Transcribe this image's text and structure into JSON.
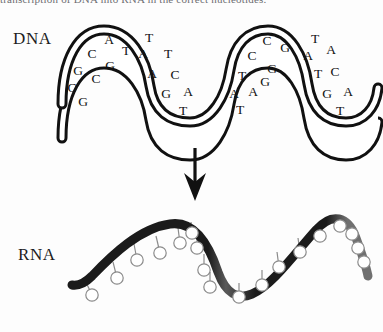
{
  "figure": {
    "title_sliver": "transcription of DNA into RNA in the correct nucleotides.",
    "background_color": "#fdfdfd",
    "ink_color": "#111111",
    "rna_ribbon_color": "#1b1b1b",
    "rna_ribbon_shade_color": "#6b6b6b"
  },
  "labels": {
    "dna": "DNA",
    "rna": "RNA"
  },
  "arrow": {
    "name": "transcription-arrow",
    "direction": "down",
    "x": 195,
    "y_top": 148,
    "y_bottom": 200
  },
  "dna": {
    "description": "Double helix ribbon with paired bases written between the two strands",
    "turns": 4,
    "segments": [
      {
        "index": 1,
        "pairs": [
          {
            "left": "A",
            "right": "T"
          },
          {
            "left": "C",
            "right": "G"
          },
          {
            "left": "G",
            "right": "C"
          },
          {
            "left": "C",
            "right": "G"
          }
        ],
        "letters": [
          {
            "char": "A",
            "x": 109,
            "y": 44
          },
          {
            "char": "T",
            "x": 126,
            "y": 55
          },
          {
            "char": "C",
            "x": 92,
            "y": 58
          },
          {
            "char": "G",
            "x": 110,
            "y": 70
          },
          {
            "char": "G",
            "x": 78,
            "y": 75
          },
          {
            "char": "C",
            "x": 96,
            "y": 83
          },
          {
            "char": "C",
            "x": 72,
            "y": 92
          },
          {
            "char": "G",
            "x": 83,
            "y": 106
          }
        ]
      },
      {
        "index": 2,
        "pairs": [
          {
            "left": "T",
            "right": "A"
          },
          {
            "left": "A",
            "right": "T"
          },
          {
            "left": "A",
            "right": "C"
          },
          {
            "left": "G",
            "right": "A"
          },
          {
            "left": "T",
            "right": ""
          }
        ],
        "letters": [
          {
            "char": "T",
            "x": 149,
            "y": 42
          },
          {
            "char": "A",
            "x": 143,
            "y": 58
          },
          {
            "char": "T",
            "x": 168,
            "y": 58
          },
          {
            "char": "A",
            "x": 152,
            "y": 78
          },
          {
            "char": "C",
            "x": 175,
            "y": 79
          },
          {
            "char": "G",
            "x": 166,
            "y": 98
          },
          {
            "char": "A",
            "x": 188,
            "y": 96
          },
          {
            "char": "T",
            "x": 183,
            "y": 115
          }
        ]
      },
      {
        "index": 3,
        "pairs": [
          {
            "left": "C",
            "right": "G"
          },
          {
            "left": "C",
            "right": "G"
          },
          {
            "left": "T",
            "right": "G"
          },
          {
            "left": "A",
            "right": "A"
          },
          {
            "left": "T",
            "right": ""
          }
        ],
        "letters": [
          {
            "char": "C",
            "x": 267,
            "y": 45
          },
          {
            "char": "G",
            "x": 285,
            "y": 52
          },
          {
            "char": "C",
            "x": 252,
            "y": 60
          },
          {
            "char": "G",
            "x": 272,
            "y": 73
          },
          {
            "char": "T",
            "x": 242,
            "y": 80
          },
          {
            "char": "G",
            "x": 265,
            "y": 86
          },
          {
            "char": "A",
            "x": 234,
            "y": 98
          },
          {
            "char": "A",
            "x": 253,
            "y": 96
          },
          {
            "char": "T",
            "x": 240,
            "y": 114
          }
        ]
      },
      {
        "index": 4,
        "pairs": [
          {
            "left": "T",
            "right": "A"
          },
          {
            "left": "A",
            "right": "T"
          },
          {
            "left": "T",
            "right": "C"
          },
          {
            "left": "G",
            "right": "A"
          },
          {
            "left": "T",
            "right": ""
          }
        ],
        "letters": [
          {
            "char": "T",
            "x": 315,
            "y": 43
          },
          {
            "char": "A",
            "x": 331,
            "y": 54
          },
          {
            "char": "A",
            "x": 308,
            "y": 60
          },
          {
            "char": "T",
            "x": 318,
            "y": 78
          },
          {
            "char": "C",
            "x": 335,
            "y": 76
          },
          {
            "char": "G",
            "x": 327,
            "y": 98
          },
          {
            "char": "A",
            "x": 348,
            "y": 96
          },
          {
            "char": "T",
            "x": 340,
            "y": 115
          }
        ]
      }
    ]
  },
  "rna": {
    "description": "Single wavy strand with open-circle bases on short stalks",
    "wave_periods": 2,
    "base_count": 18,
    "bases": [
      {
        "cx": 92,
        "cy": 295,
        "stalk_x": 84,
        "stalk_y": 278
      },
      {
        "cx": 117,
        "cy": 278,
        "stalk_x": 113,
        "stalk_y": 262
      },
      {
        "cx": 137,
        "cy": 260,
        "stalk_x": 134,
        "stalk_y": 244
      },
      {
        "cx": 160,
        "cy": 253,
        "stalk_x": 156,
        "stalk_y": 236
      },
      {
        "cx": 180,
        "cy": 243,
        "stalk_x": 178,
        "stalk_y": 228
      },
      {
        "cx": 192,
        "cy": 233,
        "stalk_x": 191,
        "stalk_y": 222
      },
      {
        "cx": 197,
        "cy": 248,
        "stalk_x": 197,
        "stalk_y": 234
      },
      {
        "cx": 204,
        "cy": 270,
        "stalk_x": 204,
        "stalk_y": 254
      },
      {
        "cx": 210,
        "cy": 287,
        "stalk_x": 210,
        "stalk_y": 272
      },
      {
        "cx": 239,
        "cy": 297,
        "stalk_x": 239,
        "stalk_y": 283
      },
      {
        "cx": 262,
        "cy": 285,
        "stalk_x": 262,
        "stalk_y": 270
      },
      {
        "cx": 279,
        "cy": 267,
        "stalk_x": 277,
        "stalk_y": 252
      },
      {
        "cx": 300,
        "cy": 252,
        "stalk_x": 298,
        "stalk_y": 238
      },
      {
        "cx": 320,
        "cy": 236,
        "stalk_x": 318,
        "stalk_y": 224
      },
      {
        "cx": 340,
        "cy": 226,
        "stalk_x": 337,
        "stalk_y": 218
      },
      {
        "cx": 352,
        "cy": 234,
        "stalk_x": 350,
        "stalk_y": 224
      },
      {
        "cx": 358,
        "cy": 248,
        "stalk_x": 357,
        "stalk_y": 237
      },
      {
        "cx": 364,
        "cy": 262,
        "stalk_x": 363,
        "stalk_y": 250
      }
    ]
  }
}
